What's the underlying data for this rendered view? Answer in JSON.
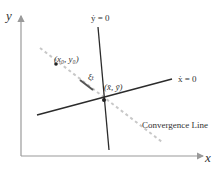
{
  "diagram": {
    "axes": {
      "x_label": "x",
      "y_label": "y",
      "color": "#9a9a9a"
    },
    "lines": {
      "ydot_zero": {
        "label": "ẏ = 0",
        "color": "#2b2b2b"
      },
      "xdot_zero": {
        "label": "ẋ = 0",
        "color": "#2b2b2b"
      },
      "convergence": {
        "label": "Convergence Line",
        "color": "#c8c8c8",
        "style": "dashed"
      }
    },
    "points": {
      "initial": {
        "label": "(x₀, y₀)"
      },
      "steady_state": {
        "label": "(x̄, ȳ)"
      }
    },
    "vector": {
      "label": "ξₜ",
      "color": "#555555"
    }
  }
}
